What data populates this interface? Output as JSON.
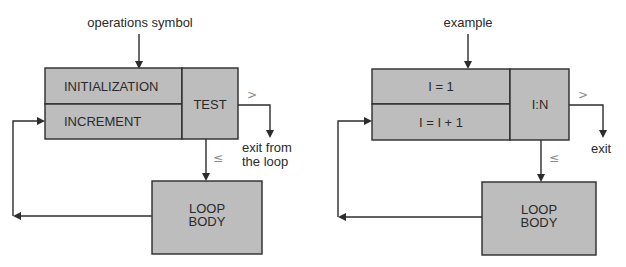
{
  "diagrams": [
    {
      "name": "general-form",
      "top_label": "operations symbol",
      "init_label": "INITIALIZATION",
      "increment_label": "INCREMENT",
      "test_label": "TEST",
      "exit_symbol": ">",
      "continue_symbol": "≤",
      "exit_label_line1": "exit from",
      "exit_label_line2": "the loop",
      "body_line1": "LOOP",
      "body_line2": "BODY"
    },
    {
      "name": "example",
      "top_label": "example",
      "init_label": "I = 1",
      "increment_label": "I = I + 1",
      "test_label": "I:N",
      "exit_symbol": ">",
      "continue_symbol": "≤",
      "exit_label_line1": "exit",
      "exit_label_line2": "",
      "body_line1": "LOOP",
      "body_line2": "BODY"
    }
  ],
  "colors": {
    "box_fill": "#bdbdbd",
    "line": "#2c2c2c",
    "symbol": "#8a8a8a"
  }
}
